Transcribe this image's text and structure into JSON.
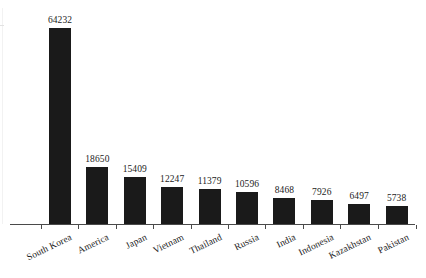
{
  "chart_data": {
    "type": "bar",
    "title": "",
    "subtitle": "",
    "xlabel": "",
    "ylabel": "",
    "grid": false,
    "legend": false,
    "ylim": [
      0,
      64232
    ],
    "categories": [
      "South Korea",
      "America",
      "Japan",
      "Vietnam",
      "Thailand",
      "Russia",
      "India",
      "Indonesia",
      "Kazakhstan",
      "Pakistan"
    ],
    "values": [
      64232,
      18650,
      15409,
      12247,
      11379,
      10596,
      8468,
      7926,
      6497,
      5738
    ],
    "data_labels": [
      "64232",
      "18650",
      "15409",
      "12247",
      "11379",
      "10596",
      "8468",
      "7926",
      "6497",
      "5738"
    ],
    "series": [
      {
        "name": "",
        "values": [
          64232,
          18650,
          15409,
          12247,
          11379,
          10596,
          8468,
          7926,
          6497,
          5738
        ]
      }
    ]
  },
  "style": {
    "bar_color": "#1a1a1a",
    "axis_color": "#4a4a4a",
    "label_color": "#1c1c1c",
    "background": "#ffffff"
  }
}
